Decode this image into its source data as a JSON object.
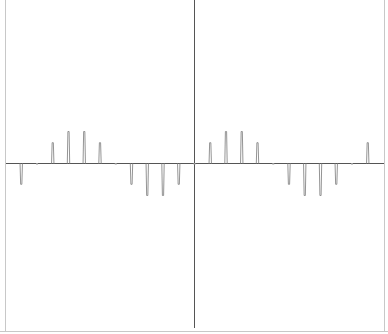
{
  "chart_data": {
    "type": "stem",
    "title": "",
    "xlabel": "",
    "ylabel": "",
    "grid": false,
    "legend": null,
    "series": [
      {
        "name": "signal",
        "x": [
          -11,
          -10,
          -9,
          -8,
          -7,
          -6,
          -5,
          -4,
          -3,
          -2,
          -1,
          0,
          1,
          2,
          3,
          4,
          5,
          6,
          7,
          8,
          9,
          10,
          11
        ],
        "values": [
          -0.65,
          0,
          0.65,
          1,
          1,
          0.65,
          0,
          -0.65,
          -1,
          -1,
          -0.65,
          0,
          0.65,
          1,
          1,
          0.65,
          0,
          -0.65,
          -1,
          -1,
          -0.65,
          0,
          0.65
        ]
      }
    ],
    "xlim": [
      -12.1,
      12.1
    ],
    "ylim": [
      -5.1,
      5.1
    ]
  },
  "style": {
    "stem_color": "#888888",
    "axis_color": "#555555",
    "border_color": "#bbbbbb",
    "background": "#ffffff"
  }
}
